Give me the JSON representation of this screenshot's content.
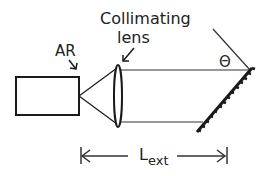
{
  "diagram": {
    "labels": {
      "ar": "AR",
      "lens_line1": "Collimating",
      "lens_line2": "lens",
      "angle": "Θ",
      "length_main": "L",
      "length_sub": "ext"
    },
    "components": [
      "laser diode (AR coated)",
      "collimating lens",
      "diffraction grating"
    ],
    "colors": {
      "stroke": "#1a1a1a",
      "text": "#222222",
      "background": "#ffffff"
    }
  }
}
